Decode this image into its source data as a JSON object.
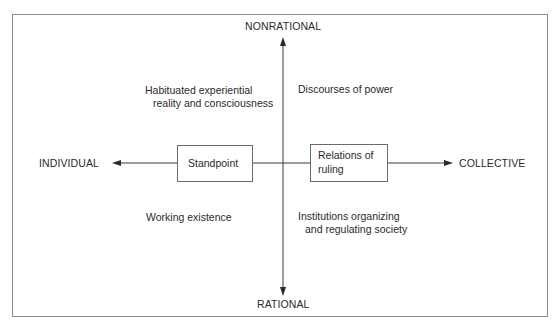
{
  "diagram": {
    "axes": {
      "top": "NONRATIONAL",
      "bottom": "RATIONAL",
      "left": "INDIVIDUAL",
      "right": "COLLECTIVE"
    },
    "quadrants": {
      "top_left": [
        "Habituated experiential",
        "reality and consciousness"
      ],
      "top_right": [
        "Discourses of power"
      ],
      "bottom_left": [
        "Working existence"
      ],
      "bottom_right": [
        "Institutions organizing",
        "and regulating society"
      ]
    },
    "boxes": {
      "left": "Standpoint",
      "right": [
        "Relations of",
        "ruling"
      ]
    },
    "colors": {
      "line": "#3a3a3a",
      "frame": "#8a8a8a",
      "text": "#2a2a2a"
    }
  }
}
